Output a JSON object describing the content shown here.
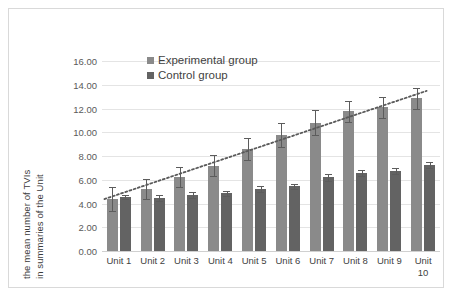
{
  "chart_data": {
    "type": "bar",
    "title": "",
    "xlabel": "",
    "ylabel": "the mean number of TVIs in summaries of the Unit",
    "ylabel_line1": "the mean number of TVIs",
    "ylabel_line2": "in summaries of the Unit",
    "ylim": [
      0,
      16
    ],
    "ytick_labels": [
      "0.00",
      "2.00",
      "4.00",
      "6.00",
      "8.00",
      "10.00",
      "12.00",
      "14.00",
      "16.00"
    ],
    "ytick_values": [
      0,
      2,
      4,
      6,
      8,
      10,
      12,
      14,
      16
    ],
    "grid": true,
    "legend_position": "top-center-inside",
    "categories": [
      "Unit 1",
      "Unit 2",
      "Unit 3",
      "Unit 4",
      "Unit 5",
      "Unit 6",
      "Unit 7",
      "Unit 8",
      "Unit 9",
      "Unit 10"
    ],
    "series": [
      {
        "name": "Experimental group",
        "color": "#8a8a8a",
        "values": [
          4.4,
          5.2,
          6.25,
          7.2,
          8.6,
          9.8,
          10.8,
          11.75,
          12.1,
          12.85
        ],
        "errors": [
          1.0,
          0.85,
          0.85,
          0.85,
          0.95,
          1.0,
          1.05,
          0.85,
          0.9,
          0.9
        ]
      },
      {
        "name": "Control group",
        "color": "#636363",
        "values": [
          4.55,
          4.5,
          4.7,
          4.85,
          5.2,
          5.45,
          6.2,
          6.55,
          6.75,
          7.25
        ],
        "errors": [
          0.2,
          0.25,
          0.25,
          0.2,
          0.25,
          0.2,
          0.3,
          0.25,
          0.25,
          0.25
        ]
      }
    ],
    "trendline": {
      "style": "dotted",
      "color": "#595959",
      "start_value": 4.6,
      "end_value": 13.2
    }
  },
  "legend": {
    "items": [
      {
        "label": "Experimental group",
        "color": "#8a8a8a"
      },
      {
        "label": "Control group",
        "color": "#636363"
      }
    ]
  },
  "colors": {
    "experimental": "#8a8a8a",
    "control": "#636363",
    "gridline": "#e4e4e4",
    "frame": "#d9d9d9",
    "text": "#3f3f3f",
    "trendline": "#595959"
  }
}
